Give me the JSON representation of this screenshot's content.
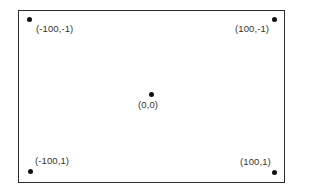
{
  "diagram": {
    "colors": {
      "frame": "#2a2a2a",
      "dot": "#111111",
      "text": "#333333",
      "background": "#ffffff"
    },
    "points": [
      {
        "id": "top-left",
        "label": "(-100,-1)"
      },
      {
        "id": "top-right",
        "label": "(100,-1)"
      },
      {
        "id": "center",
        "label": "(0,0)"
      },
      {
        "id": "bottom-left",
        "label": "(-100,1)"
      },
      {
        "id": "bottom-right",
        "label": "(100,1)"
      }
    ]
  }
}
